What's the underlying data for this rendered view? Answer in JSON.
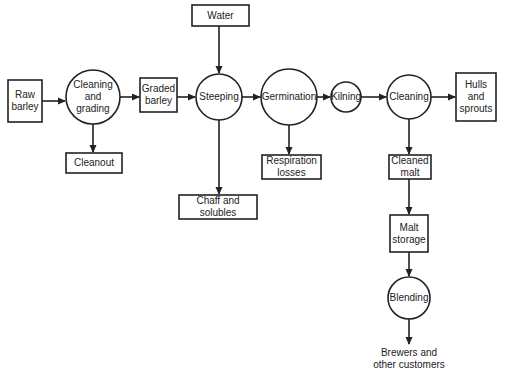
{
  "diagram": {
    "nodes": {
      "raw_barley": {
        "label": "Raw barley",
        "shape": "box"
      },
      "cleaning_grading": {
        "label": "Cleaning and grading",
        "shape": "circle"
      },
      "cleanout": {
        "label": "Cleanout",
        "shape": "box"
      },
      "graded_barley": {
        "label": "Graded barley",
        "shape": "box"
      },
      "water": {
        "label": "Water",
        "shape": "box"
      },
      "steeping": {
        "label": "Steeping",
        "shape": "circle"
      },
      "chaff_solubles": {
        "label": "Chaff and solubles",
        "shape": "box"
      },
      "germination": {
        "label": "Germination",
        "shape": "circle"
      },
      "respiration_losses": {
        "label": "Respiration losses",
        "shape": "box"
      },
      "kilning": {
        "label": "Kilning",
        "shape": "circle"
      },
      "cleaning": {
        "label": "Cleaning",
        "shape": "circle"
      },
      "hulls_sprouts": {
        "label": "Hulls and sprouts",
        "shape": "box"
      },
      "cleaned_malt": {
        "label": "Cleaned malt",
        "shape": "box"
      },
      "malt_storage": {
        "label": "Malt storage",
        "shape": "box"
      },
      "blending": {
        "label": "Blending",
        "shape": "circle"
      },
      "brewers": {
        "label": "Brewers and other customers",
        "shape": "text"
      }
    },
    "edges": [
      [
        "raw_barley",
        "cleaning_grading"
      ],
      [
        "cleaning_grading",
        "graded_barley"
      ],
      [
        "cleaning_grading",
        "cleanout"
      ],
      [
        "graded_barley",
        "steeping"
      ],
      [
        "water",
        "steeping"
      ],
      [
        "steeping",
        "chaff_solubles"
      ],
      [
        "steeping",
        "germination"
      ],
      [
        "germination",
        "respiration_losses"
      ],
      [
        "germination",
        "kilning"
      ],
      [
        "kilning",
        "cleaning"
      ],
      [
        "cleaning",
        "hulls_sprouts"
      ],
      [
        "cleaning",
        "cleaned_malt"
      ],
      [
        "cleaned_malt",
        "malt_storage"
      ],
      [
        "malt_storage",
        "blending"
      ],
      [
        "blending",
        "brewers"
      ]
    ]
  }
}
